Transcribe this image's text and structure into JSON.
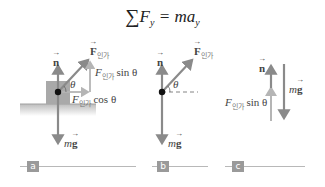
{
  "equation": {
    "sigma": "∑",
    "lhs": "F",
    "lhs_sub": "y",
    "equals": " = ",
    "rhs": "ma",
    "rhs_sub": "y"
  },
  "panels": [
    {
      "tag": "a",
      "labels": {
        "normal": "n",
        "applied_force": "F",
        "applied_sub": "인가",
        "vertical_component": "F",
        "vertical_trig": "sin θ",
        "horizontal_component": "F",
        "horizontal_trig": "cos θ",
        "angle": "θ",
        "weight_m": "m",
        "weight_g": "g"
      }
    },
    {
      "tag": "b",
      "labels": {
        "normal": "n",
        "applied_force": "F",
        "applied_sub": "인가",
        "angle": "θ",
        "weight_m": "m",
        "weight_g": "g"
      }
    },
    {
      "tag": "c",
      "labels": {
        "normal": "n",
        "vertical_component": "F",
        "applied_sub": "인가",
        "vertical_trig": "sin θ",
        "weight_m": "m",
        "weight_g": "g"
      }
    }
  ],
  "colors": {
    "arrow": "#8a8a8a",
    "component_arrow": "#b5b5b5",
    "block": "#a9a9a9",
    "ground": "#c8c8c8",
    "tag_bg": "#9a9a9a"
  }
}
